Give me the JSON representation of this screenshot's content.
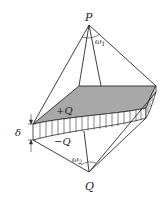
{
  "diagram": {
    "labels": {
      "apex_top": "P",
      "apex_bottom": "Q",
      "omega_top": "ω",
      "omega_top_sub": "1",
      "omega_bottom": "ω",
      "omega_bottom_sub": "2",
      "positive_charge": "+Q",
      "negative_charge": "−Q",
      "thickness": "δ"
    },
    "colors": {
      "top_surface_fill": "#a8a8a8",
      "stroke": "#2a2a2a",
      "background": "#ffffff"
    }
  }
}
